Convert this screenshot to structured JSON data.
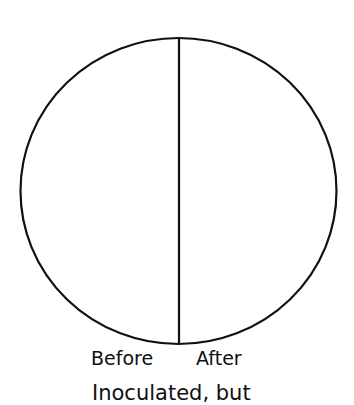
{
  "diagram": {
    "shape": "circle divided vertically into two halves",
    "stroke_color": "#111111",
    "background_color": "#ffffff",
    "halves": [
      {
        "position": "left",
        "label": "Before"
      },
      {
        "position": "right",
        "label": "After"
      }
    ],
    "caption": "Inoculated, but"
  }
}
